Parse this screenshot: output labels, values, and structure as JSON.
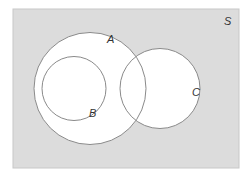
{
  "diagram": {
    "type": "venn",
    "universe": {
      "label": "S",
      "x": 13,
      "y": 9,
      "width": 226,
      "height": 159,
      "fill": "#dcdcdc",
      "stroke": "#c8c8c8"
    },
    "sets": [
      {
        "label": "A",
        "cx": 90,
        "cy": 88.5,
        "r": 56,
        "fill": "#ffffff",
        "stroke": "#8a8a8a",
        "label_x": 107,
        "label_y": 43
      },
      {
        "label": "B",
        "cx": 74,
        "cy": 88.5,
        "r": 32,
        "fill": "none",
        "stroke": "#8a8a8a",
        "label_x": 89,
        "label_y": 117
      },
      {
        "label": "C",
        "cx": 160,
        "cy": 88.5,
        "r": 40,
        "fill": "#ffffff",
        "stroke": "#8a8a8a",
        "label_x": 192,
        "label_y": 96
      }
    ],
    "relations": [
      "B is a subset of A",
      "A and C overlap",
      "B and C are disjoint"
    ]
  }
}
